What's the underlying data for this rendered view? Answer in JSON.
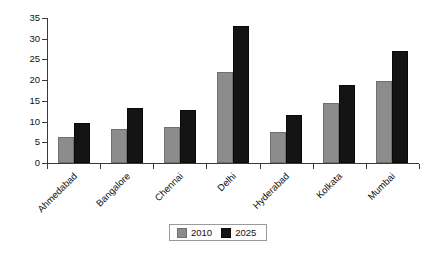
{
  "chart_data": {
    "type": "bar",
    "title": "",
    "subtitle": "",
    "xlabel": "",
    "ylabel": "",
    "ylim": [
      0,
      35
    ],
    "ytick_step": 5,
    "yticks": [
      0,
      5,
      10,
      15,
      20,
      25,
      30,
      35
    ],
    "ytick_labels": [
      "0",
      "5",
      "10",
      "15",
      "20",
      "25",
      "30",
      "35"
    ],
    "grid": false,
    "legend_position": "bottom-center",
    "categories": [
      "Ahmedabad",
      "Bangalore",
      "Chennai",
      "Delhi",
      "Hyderabad",
      "Kolkata",
      "Mumbai"
    ],
    "series": [
      {
        "name": "2010",
        "color": "#8c8c8c",
        "values": [
          6.2,
          8.2,
          8.6,
          22.0,
          7.5,
          14.5,
          19.8
        ]
      },
      {
        "name": "2025",
        "color": "#141414",
        "values": [
          9.7,
          13.2,
          12.8,
          33.0,
          11.6,
          18.8,
          27.0
        ]
      }
    ]
  }
}
